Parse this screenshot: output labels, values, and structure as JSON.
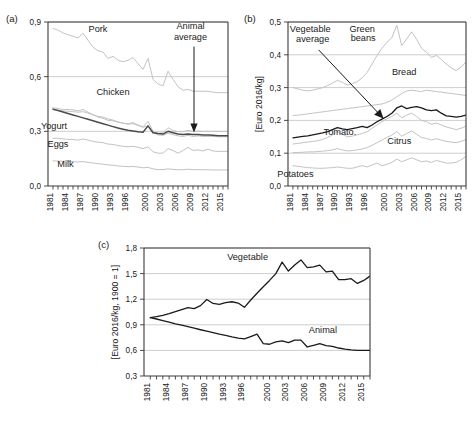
{
  "figure": {
    "panels": [
      {
        "tag": "(a)"
      },
      {
        "tag": "(b)"
      },
      {
        "tag": "(c)"
      }
    ]
  },
  "chart_data": [
    {
      "panel": "(a)",
      "type": "line",
      "title": "",
      "xlabel": "",
      "ylabel": "",
      "xlim": [
        1980,
        2016
      ],
      "ylim": [
        0.0,
        0.9
      ],
      "yticks": [
        "0,0",
        "0,3",
        "0,6",
        "0,9"
      ],
      "ytickvals": [
        0.0,
        0.3,
        0.6,
        0.9
      ],
      "xticks": [
        "1981",
        "1984",
        "1987",
        "1990",
        "1993",
        "1996",
        "2000",
        "2003",
        "2006",
        "2009",
        "2012",
        "2015"
      ],
      "xtickvals": [
        1981,
        1984,
        1987,
        1990,
        1993,
        1996,
        2000,
        2003,
        2006,
        2009,
        2012,
        2015
      ],
      "grid": true,
      "legend_position": "inline-annotations",
      "annotations": [
        {
          "text": "Pork",
          "x": 1990,
          "y": 0.845
        },
        {
          "text": "Chicken",
          "x": 1993,
          "y": 0.5
        },
        {
          "text": "Yogurt",
          "x": 1981.2,
          "y": 0.315
        },
        {
          "text": "Eggs",
          "x": 1982,
          "y": 0.215
        },
        {
          "text": "Milk",
          "x": 1983.5,
          "y": 0.105
        },
        {
          "text": "Animal",
          "x": 2008.5,
          "y": 0.86
        },
        {
          "text": "average",
          "x": 2008.5,
          "y": 0.8
        }
      ],
      "x": [
        1981,
        1982,
        1983,
        1984,
        1985,
        1986,
        1987,
        1988,
        1989,
        1990,
        1991,
        1992,
        1993,
        1994,
        1995,
        1996,
        1997,
        1998,
        1999,
        2000,
        2001,
        2002,
        2003,
        2004,
        2005,
        2006,
        2007,
        2008,
        2009,
        2010,
        2011,
        2012,
        2013,
        2014,
        2015,
        2016
      ],
      "series": [
        {
          "name": "Pork",
          "style": "faint",
          "values": [
            0.865,
            0.855,
            0.84,
            0.83,
            0.822,
            0.812,
            0.838,
            0.8,
            0.762,
            0.742,
            0.735,
            0.7,
            0.712,
            0.69,
            0.682,
            0.69,
            0.705,
            0.672,
            0.64,
            0.7,
            0.585,
            0.56,
            0.55,
            0.63,
            0.585,
            0.545,
            0.525,
            0.53,
            0.52,
            0.52,
            0.52,
            0.52,
            0.515,
            0.512,
            0.512,
            0.512
          ]
        },
        {
          "name": "Chicken",
          "style": "faint",
          "values": [
            0.43,
            0.425,
            0.42,
            0.42,
            0.418,
            0.412,
            0.42,
            0.405,
            0.392,
            0.378,
            0.372,
            0.36,
            0.358,
            0.35,
            0.345,
            0.34,
            0.348,
            0.335,
            0.325,
            0.355,
            0.3,
            0.29,
            0.292,
            0.32,
            0.305,
            0.298,
            0.298,
            0.305,
            0.3,
            0.302,
            0.3,
            0.3,
            0.3,
            0.3,
            0.3,
            0.3
          ]
        },
        {
          "name": "Yogurt",
          "style": "faint",
          "values": [
            0.418,
            0.415,
            0.412,
            0.41,
            0.408,
            0.405,
            0.408,
            0.4,
            0.39,
            0.382,
            0.378,
            0.368,
            0.362,
            0.352,
            0.345,
            0.34,
            0.342,
            0.332,
            0.322,
            0.33,
            0.292,
            0.28,
            0.278,
            0.29,
            0.282,
            0.275,
            0.272,
            0.278,
            0.272,
            0.275,
            0.272,
            0.272,
            0.272,
            0.27,
            0.27,
            0.27
          ]
        },
        {
          "name": "Eggs",
          "style": "faint",
          "values": [
            0.262,
            0.262,
            0.258,
            0.256,
            0.255,
            0.252,
            0.258,
            0.252,
            0.245,
            0.24,
            0.238,
            0.23,
            0.228,
            0.222,
            0.218,
            0.215,
            0.218,
            0.212,
            0.205,
            0.215,
            0.188,
            0.18,
            0.18,
            0.205,
            0.195,
            0.18,
            0.195,
            0.212,
            0.195,
            0.198,
            0.192,
            0.202,
            0.192,
            0.19,
            0.19,
            0.19
          ]
        },
        {
          "name": "Milk",
          "style": "faint",
          "values": [
            0.138,
            0.137,
            0.136,
            0.135,
            0.134,
            0.132,
            0.134,
            0.13,
            0.126,
            0.122,
            0.12,
            0.116,
            0.114,
            0.11,
            0.108,
            0.106,
            0.107,
            0.104,
            0.1,
            0.102,
            0.094,
            0.09,
            0.09,
            0.094,
            0.091,
            0.089,
            0.089,
            0.092,
            0.09,
            0.09,
            0.089,
            0.089,
            0.088,
            0.088,
            0.088,
            0.088
          ]
        },
        {
          "name": "Animal average",
          "style": "bold",
          "values": [
            0.422,
            0.414,
            0.406,
            0.398,
            0.39,
            0.382,
            0.374,
            0.366,
            0.358,
            0.35,
            0.342,
            0.334,
            0.326,
            0.318,
            0.312,
            0.306,
            0.302,
            0.298,
            0.295,
            0.33,
            0.292,
            0.288,
            0.285,
            0.3,
            0.292,
            0.285,
            0.282,
            0.285,
            0.282,
            0.282,
            0.28,
            0.28,
            0.278,
            0.276,
            0.276,
            0.276
          ]
        }
      ]
    },
    {
      "panel": "(b)",
      "type": "line",
      "title": "",
      "xlabel": "",
      "ylabel": "[Euro 2016/kg]",
      "xlim": [
        1980,
        2016
      ],
      "ylim": [
        0.0,
        0.5
      ],
      "yticks": [
        "0,0",
        "0,1",
        "0,2",
        "0,3",
        "0,4",
        "0,5"
      ],
      "ytickvals": [
        0.0,
        0.1,
        0.2,
        0.3,
        0.4,
        0.5
      ],
      "xticks": [
        "1981",
        "1984",
        "1987",
        "1990",
        "1993",
        "1996",
        "2000",
        "2003",
        "2006",
        "2009",
        "2012",
        "2015"
      ],
      "xtickvals": [
        1981,
        1984,
        1987,
        1990,
        1993,
        1996,
        2000,
        2003,
        2006,
        2009,
        2012,
        2015
      ],
      "grid": true,
      "legend_position": "inline-annotations",
      "annotations": [
        {
          "text": "Vegetable",
          "x": 1984.5,
          "y": 0.468
        },
        {
          "text": "average",
          "x": 1985.0,
          "y": 0.44
        },
        {
          "text": "Green",
          "x": 1995.0,
          "y": 0.47
        },
        {
          "text": "beans",
          "x": 1995.2,
          "y": 0.443
        },
        {
          "text": "Bread",
          "x": 2003.5,
          "y": 0.338
        },
        {
          "text": "Tomato.",
          "x": 1990.5,
          "y": 0.156
        },
        {
          "text": "Citrus",
          "x": 2002.5,
          "y": 0.128
        },
        {
          "text": "Potatoes",
          "x": 1981.5,
          "y": 0.028
        }
      ],
      "x": [
        1981,
        1982,
        1983,
        1984,
        1985,
        1986,
        1987,
        1988,
        1989,
        1990,
        1991,
        1992,
        1993,
        1994,
        1995,
        1996,
        1997,
        1998,
        1999,
        2000,
        2001,
        2002,
        2003,
        2004,
        2005,
        2006,
        2007,
        2008,
        2009,
        2010,
        2011,
        2012,
        2013,
        2014,
        2015,
        2016
      ],
      "series": [
        {
          "name": "Green beans",
          "style": "faint",
          "values": [
            0.3,
            0.296,
            0.292,
            0.29,
            0.292,
            0.296,
            0.3,
            0.306,
            0.314,
            0.322,
            0.316,
            0.308,
            0.312,
            0.318,
            0.33,
            0.346,
            0.372,
            0.398,
            0.42,
            0.438,
            0.452,
            0.49,
            0.428,
            0.448,
            0.47,
            0.448,
            0.42,
            0.408,
            0.392,
            0.398,
            0.386,
            0.372,
            0.36,
            0.352,
            0.362,
            0.378
          ]
        },
        {
          "name": "Bread",
          "style": "faint",
          "values": [
            0.215,
            0.216,
            0.218,
            0.22,
            0.222,
            0.224,
            0.226,
            0.228,
            0.23,
            0.232,
            0.234,
            0.236,
            0.238,
            0.24,
            0.242,
            0.244,
            0.246,
            0.248,
            0.25,
            0.255,
            0.262,
            0.272,
            0.282,
            0.29,
            0.292,
            0.29,
            0.288,
            0.292,
            0.29,
            0.288,
            0.286,
            0.284,
            0.282,
            0.28,
            0.278,
            0.276
          ]
        },
        {
          "name": "Tomato",
          "style": "faint",
          "values": [
            0.128,
            0.13,
            0.132,
            0.134,
            0.136,
            0.138,
            0.142,
            0.148,
            0.156,
            0.166,
            0.158,
            0.15,
            0.152,
            0.156,
            0.16,
            0.166,
            0.176,
            0.186,
            0.196,
            0.205,
            0.212,
            0.222,
            0.208,
            0.216,
            0.222,
            0.212,
            0.2,
            0.196,
            0.188,
            0.192,
            0.186,
            0.18,
            0.176,
            0.172,
            0.176,
            0.182
          ]
        },
        {
          "name": "Citrus",
          "style": "faint",
          "values": [
            0.102,
            0.102,
            0.103,
            0.104,
            0.104,
            0.105,
            0.106,
            0.108,
            0.11,
            0.114,
            0.11,
            0.107,
            0.108,
            0.11,
            0.113,
            0.117,
            0.124,
            0.132,
            0.14,
            0.148,
            0.155,
            0.166,
            0.152,
            0.16,
            0.168,
            0.158,
            0.148,
            0.145,
            0.14,
            0.144,
            0.14,
            0.136,
            0.134,
            0.132,
            0.136,
            0.142
          ]
        },
        {
          "name": "Potatoes",
          "style": "faint",
          "values": [
            0.062,
            0.06,
            0.058,
            0.056,
            0.055,
            0.054,
            0.054,
            0.055,
            0.056,
            0.058,
            0.056,
            0.054,
            0.054,
            0.058,
            0.062,
            0.058,
            0.064,
            0.07,
            0.062,
            0.066,
            0.072,
            0.082,
            0.074,
            0.08,
            0.086,
            0.08,
            0.074,
            0.076,
            0.072,
            0.078,
            0.074,
            0.07,
            0.07,
            0.072,
            0.08,
            0.09
          ]
        },
        {
          "name": "Vegetable average",
          "style": "black",
          "values": [
            0.147,
            0.149,
            0.151,
            0.153,
            0.156,
            0.159,
            0.162,
            0.166,
            0.172,
            0.178,
            0.174,
            0.172,
            0.175,
            0.178,
            0.182,
            0.178,
            0.186,
            0.196,
            0.204,
            0.212,
            0.222,
            0.238,
            0.244,
            0.236,
            0.24,
            0.242,
            0.238,
            0.232,
            0.23,
            0.232,
            0.222,
            0.214,
            0.212,
            0.21,
            0.212,
            0.216
          ]
        }
      ]
    },
    {
      "panel": "(c)",
      "type": "line",
      "title": "",
      "xlabel": "",
      "ylabel": "[Euro 2016/kg, 1900 = 1]",
      "xlim": [
        1980,
        2016
      ],
      "ylim": [
        0.3,
        1.8
      ],
      "yticks": [
        "0,3",
        "0,6",
        "0,9",
        "1,2",
        "1,5",
        "1,8"
      ],
      "ytickvals": [
        0.3,
        0.6,
        0.9,
        1.2,
        1.5,
        1.8
      ],
      "xticks": [
        "1981",
        "1984",
        "1987",
        "1990",
        "1993",
        "1996",
        "2000",
        "2003",
        "2006",
        "2009",
        "2012",
        "2015"
      ],
      "xtickvals": [
        1981,
        1984,
        1987,
        1990,
        1993,
        1996,
        2000,
        2003,
        2006,
        2009,
        2012,
        2015
      ],
      "grid": true,
      "legend_position": "inline-annotations",
      "annotations": [
        {
          "text": "Vegetable",
          "x": 1996.5,
          "y": 1.66
        },
        {
          "text": "Animal",
          "x": 2008.5,
          "y": 0.8
        }
      ],
      "x": [
        1981,
        1982,
        1983,
        1984,
        1985,
        1986,
        1987,
        1988,
        1989,
        1990,
        1991,
        1992,
        1993,
        1994,
        1995,
        1996,
        1997,
        1998,
        1999,
        2000,
        2001,
        2002,
        2003,
        2004,
        2005,
        2006,
        2007,
        2008,
        2009,
        2010,
        2011,
        2012,
        2013,
        2014,
        2015,
        2016
      ],
      "series": [
        {
          "name": "Vegetable",
          "style": "black",
          "values": [
            0.985,
            0.995,
            1.01,
            1.03,
            1.055,
            1.078,
            1.1,
            1.09,
            1.125,
            1.196,
            1.15,
            1.14,
            1.16,
            1.17,
            1.155,
            1.105,
            1.19,
            1.27,
            1.345,
            1.42,
            1.5,
            1.635,
            1.53,
            1.6,
            1.66,
            1.57,
            1.58,
            1.6,
            1.52,
            1.53,
            1.43,
            1.43,
            1.44,
            1.385,
            1.42,
            1.47
          ]
        },
        {
          "name": "Animal",
          "style": "black",
          "values": [
            0.985,
            0.968,
            0.95,
            0.932,
            0.912,
            0.895,
            0.878,
            0.86,
            0.842,
            0.825,
            0.808,
            0.79,
            0.775,
            0.758,
            0.745,
            0.735,
            0.762,
            0.79,
            0.68,
            0.672,
            0.7,
            0.712,
            0.69,
            0.72,
            0.72,
            0.64,
            0.66,
            0.68,
            0.655,
            0.648,
            0.628,
            0.615,
            0.605,
            0.6,
            0.6,
            0.6
          ]
        }
      ]
    }
  ]
}
